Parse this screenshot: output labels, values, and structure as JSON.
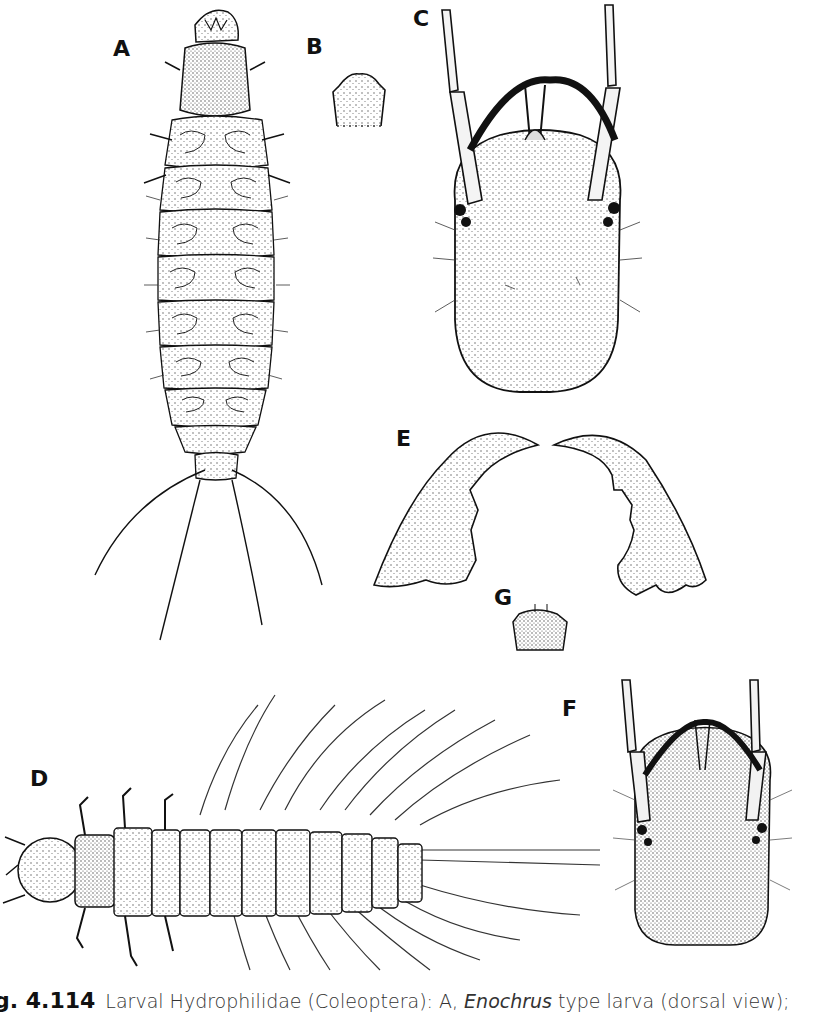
{
  "figure": {
    "panel_labels": {
      "A": "A",
      "B": "B",
      "C": "C",
      "D": "D",
      "E": "E",
      "F": "F",
      "G": "G"
    },
    "caption": {
      "number": "g. 4.114",
      "text_before_italic": "Larval Hydrophilidae (Coleoptera): A, ",
      "italic": "Enochrus",
      "text_after_italic": " type larva (dorsal view);"
    },
    "colors": {
      "ink": "#111111",
      "stipple": "#444444",
      "background": "#ffffff"
    }
  }
}
